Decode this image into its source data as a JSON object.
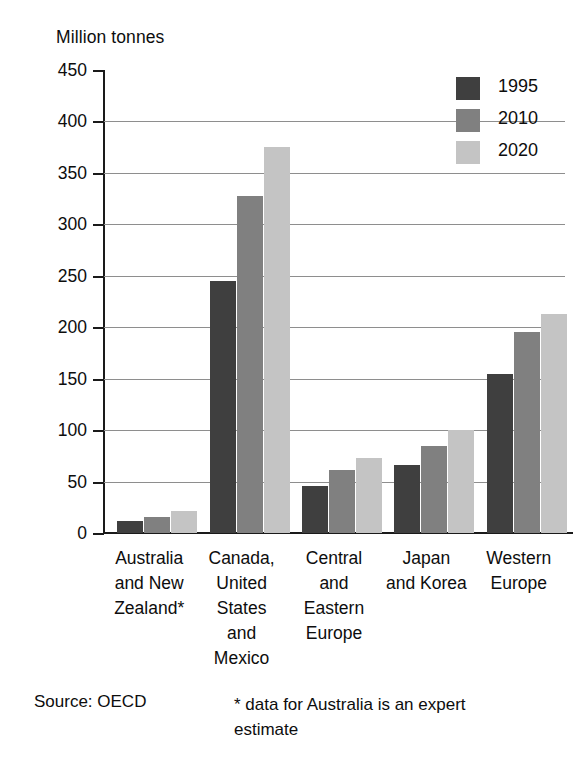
{
  "chart_data": {
    "type": "bar",
    "title": "Million tonnes",
    "xlabel": "",
    "ylabel": "Million tonnes",
    "ylim": [
      0,
      450
    ],
    "yticks": [
      0,
      50,
      100,
      150,
      200,
      250,
      300,
      350,
      400,
      450
    ],
    "grid": true,
    "legend_position": "top-right",
    "categories": [
      "Australia and New Zealand*",
      "Canada, United States and Mexico",
      "Central and Eastern Europe",
      "Japan and Korea",
      "Western Europe"
    ],
    "category_lines": [
      [
        "Australia",
        "and New",
        "Zealand*"
      ],
      [
        "Canada,",
        "United",
        "States",
        "and",
        "Mexico"
      ],
      [
        "Central",
        "and",
        "Eastern",
        "Europe"
      ],
      [
        "Japan",
        "and Korea"
      ],
      [
        "Western",
        "Europe"
      ]
    ],
    "series": [
      {
        "name": "1995",
        "color": "#3f3f3f",
        "values": [
          12,
          245,
          46,
          66,
          155
        ]
      },
      {
        "name": "2010",
        "color": "#808080",
        "values": [
          16,
          328,
          61,
          85,
          195
        ]
      },
      {
        "name": "2020",
        "color": "#c4c4c4",
        "values": [
          21,
          375,
          73,
          100,
          213
        ]
      }
    ],
    "source": "Source: OECD",
    "footnote": "* data for Australia is an expert estimate"
  },
  "legend": {
    "items": [
      {
        "label": "1995",
        "color": "#3f3f3f"
      },
      {
        "label": "2010",
        "color": "#808080"
      },
      {
        "label": "2020",
        "color": "#c4c4c4"
      }
    ]
  },
  "axis": {
    "ticks": [
      "450",
      "400",
      "350",
      "300",
      "250",
      "200",
      "150",
      "100",
      "50",
      "0"
    ]
  }
}
